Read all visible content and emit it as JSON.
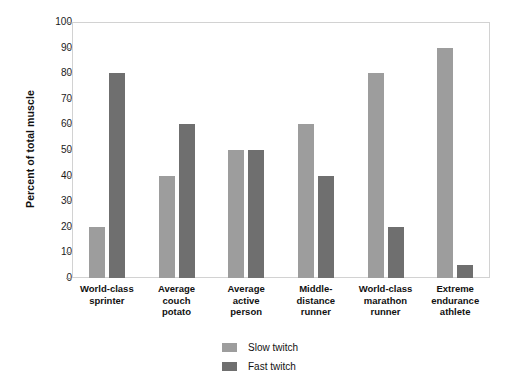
{
  "chart_data": {
    "type": "bar",
    "title": "",
    "xlabel": "",
    "ylabel": "Percent of total muscle",
    "ylim": [
      0,
      100
    ],
    "yticks": [
      0,
      10,
      20,
      30,
      40,
      50,
      60,
      70,
      80,
      90,
      100
    ],
    "grid": false,
    "legend_position": "bottom-center",
    "categories": [
      "World-class sprinter",
      "Average couch potato",
      "Average active person",
      "Middle-distance runner",
      "World-class marathon runner",
      "Extreme endurance athlete"
    ],
    "category_lines": [
      [
        "World-class",
        "sprinter"
      ],
      [
        "Average",
        "couch",
        "potato"
      ],
      [
        "Average",
        "active",
        "person"
      ],
      [
        "Middle-",
        "distance",
        "runner"
      ],
      [
        "World-class",
        "marathon",
        "runner"
      ],
      [
        "Extreme",
        "endurance",
        "athlete"
      ]
    ],
    "series": [
      {
        "name": "Slow twitch",
        "color": "#9d9d9d",
        "values": [
          20,
          40,
          50,
          60,
          80,
          90
        ]
      },
      {
        "name": "Fast twitch",
        "color": "#6f6f6f",
        "values": [
          80,
          60,
          50,
          40,
          20,
          5
        ]
      }
    ]
  },
  "legend": {
    "items": [
      {
        "label": "Slow twitch",
        "swatch": "slow"
      },
      {
        "label": "Fast twitch",
        "swatch": "fast"
      }
    ]
  },
  "colors": {
    "slow_twitch": "#9d9d9d",
    "fast_twitch": "#6f6f6f",
    "plot_border": "#d2d2d2",
    "background": "#ffffff",
    "text": "#111111"
  }
}
